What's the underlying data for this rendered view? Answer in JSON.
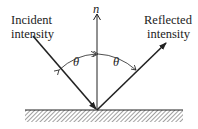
{
  "diagram": {
    "labels": {
      "incident_line1": "Incident",
      "incident_line2": "intensity",
      "reflected_line1": "Reflected",
      "reflected_line2": "intensity",
      "normal": "n",
      "angle_left": "θ",
      "angle_right": "θ"
    },
    "colors": {
      "ink": "#222222",
      "background": "#ffffff"
    }
  }
}
